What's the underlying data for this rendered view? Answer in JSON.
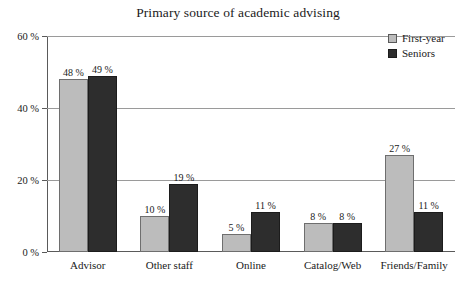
{
  "chart_data": {
    "type": "bar",
    "title": "Primary source of academic advising",
    "xlabel": "",
    "ylabel": "",
    "categories": [
      "Advisor",
      "Other staff",
      "Online",
      "Catalog/Web",
      "Friends/Family"
    ],
    "series": [
      {
        "name": "First-year",
        "color": "#bcbcbc",
        "values": [
          48,
          10,
          5,
          8,
          27
        ],
        "labels": [
          "48 %",
          "10 %",
          "5 %",
          "8 %",
          "27 %"
        ]
      },
      {
        "name": "Seniors",
        "color": "#2d2d2d",
        "values": [
          49,
          19,
          11,
          8,
          11
        ],
        "labels": [
          "49 %",
          "19 %",
          "11 %",
          "8 %",
          "11 %"
        ]
      }
    ],
    "ylim": [
      0,
      60
    ],
    "yticks": [
      0,
      20,
      40,
      60
    ],
    "ytick_labels": [
      "0 %",
      "20 %",
      "40 %",
      "60 %"
    ],
    "grid": true,
    "legend_position": "top-right",
    "legend_entries": [
      "First-year",
      "Seniors"
    ]
  }
}
